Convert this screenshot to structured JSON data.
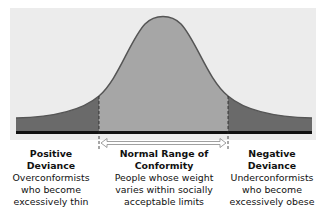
{
  "diagram": {
    "type": "normal-distribution-curve",
    "colors": {
      "background_panel": "#ececec",
      "tail_fill": "#6a6a6a",
      "center_fill": "#a6a6a6",
      "curve_stroke": "#555555",
      "baseline": "#111111"
    },
    "regions": [
      {
        "id": "positive",
        "title": "Positive Deviance",
        "title_line1": "Positive",
        "title_line2": "Deviance",
        "desc_line1": "Overconformists",
        "desc_line2": "who become",
        "desc_line3": "excessively thin"
      },
      {
        "id": "normal",
        "title": "Normal Range of Conformity",
        "title_line1": "Normal Range of",
        "title_line2": "Conformity",
        "desc_line1": "People whose weight",
        "desc_line2": "varies within socially",
        "desc_line3": "acceptable limits"
      },
      {
        "id": "negative",
        "title": "Negative Deviance",
        "title_line1": "Negative",
        "title_line2": "Deviance",
        "desc_line1": "Underconformists",
        "desc_line2": "who become",
        "desc_line3": "excessively obese"
      }
    ],
    "range_arrow": "double-headed-arrow"
  }
}
